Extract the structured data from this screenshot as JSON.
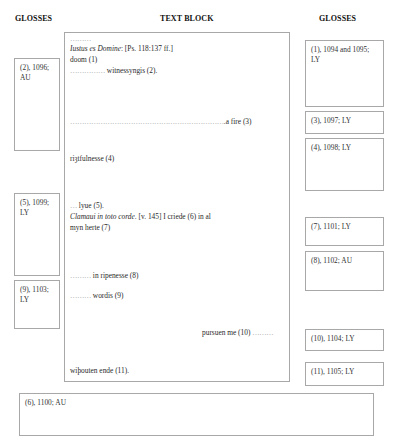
{
  "headings": {
    "left": "GLOSSES",
    "center": "TEXT BLOCK",
    "right": "GLOSSES"
  },
  "left_glosses": [
    {
      "ref": "(2), 1096;",
      "source": "AU"
    },
    {
      "ref": "(5), 1099;",
      "source": "LY"
    },
    {
      "ref": "(9), 1103;",
      "source": "LY"
    }
  ],
  "right_glosses": [
    {
      "ref": "(1), 1094 and 1095;",
      "source": "LY"
    },
    {
      "text": "(3), 1097; LY"
    },
    {
      "text": "(4), 1098; LY"
    },
    {
      "text": "(7), 1101; LY"
    },
    {
      "text": "(8), 1102; AU"
    },
    {
      "text": "(10), 1104; LY"
    },
    {
      "text": "(11), 1105; LY"
    }
  ],
  "bottom_gloss": {
    "text": "(6), 1100; AU"
  },
  "text_block": {
    "lines": [
      {
        "dots": "………"
      },
      {
        "latin": "Iustus es Domine",
        "rest": ": [Ps. 118:137 ff.]"
      },
      {
        "text": "doom (1)"
      },
      {
        "dots": "……………",
        "text": " witnessyngis (2)."
      },
      {
        "dots": "…………………………………………………………",
        "text": ".a fire (3)"
      },
      {
        "text": "riȝtfulnesse  (4)"
      },
      {
        "dots": "…",
        "text": " lyue (5)."
      },
      {
        "latin": "Clamaui in toto corde",
        "rest": ". [v. 145]  I criede (6) in al"
      },
      {
        "text": "myn herte (7)"
      },
      {
        "dots": "………",
        "text": " in ripenesse (8)"
      },
      {
        "dots": "………",
        "text": " wordis (9)"
      },
      {
        "text": "pursuen me (10) ",
        "dots": "………"
      },
      {
        "text": "wiþouten ende (11)."
      }
    ]
  }
}
